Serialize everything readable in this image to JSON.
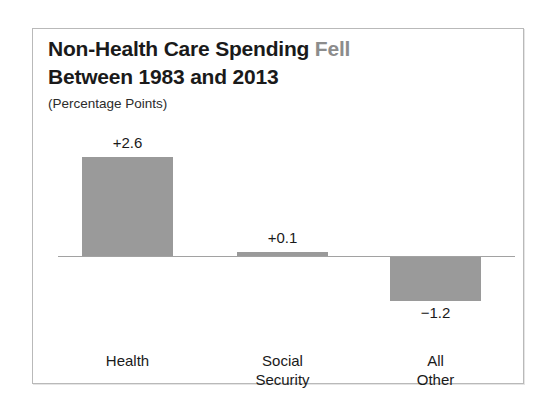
{
  "figure": {
    "title_line_1_main": "Non-Health Care Spending",
    "title_line_1_accent": "Fell",
    "title_line_2": "Between 1983 and 2013",
    "subtitle": "(Percentage Points)"
  },
  "chart_data": {
    "type": "bar",
    "subtitle": "(Percentage Points)",
    "xlabel": "",
    "ylabel": "",
    "categories": [
      "Health",
      "Social Security",
      "All Other"
    ],
    "category_lines": [
      [
        "Health"
      ],
      [
        "Social",
        "Security"
      ],
      [
        "All",
        "Other"
      ]
    ],
    "values": [
      2.6,
      0.1,
      -1.2
    ],
    "value_labels": [
      "+2.6",
      "+0.1",
      "−1.2"
    ],
    "ylim": [
      -1.2,
      2.6
    ],
    "grid": false,
    "legend": null,
    "zero_line": true,
    "bar_color": "#9a9a9a",
    "accent_color": "#8c8c8c",
    "text_color": "#1a1a1a",
    "axis_line_color": "#a2a2a2"
  }
}
